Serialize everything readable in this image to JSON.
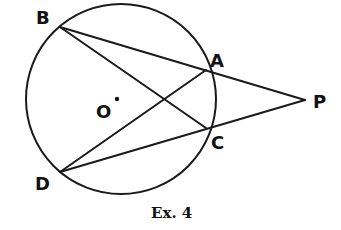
{
  "figure": {
    "caption": "Ex. 4",
    "circle": {
      "center_label": "O",
      "cx": 121,
      "cy": 99,
      "r": 95
    },
    "points": {
      "B": {
        "label": "B",
        "x": 60,
        "y": 27
      },
      "A": {
        "label": "A",
        "x": 206,
        "y": 70
      },
      "C": {
        "label": "C",
        "x": 206,
        "y": 128
      },
      "D": {
        "label": "D",
        "x": 60,
        "y": 172
      },
      "P": {
        "label": "P",
        "x": 305,
        "y": 100
      },
      "O": {
        "label": "O",
        "x": 118,
        "y": 99
      }
    },
    "segments": [
      "B-P",
      "B-C",
      "D-A",
      "D-P"
    ]
  }
}
